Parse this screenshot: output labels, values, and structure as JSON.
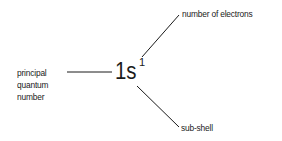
{
  "diagram": {
    "notation": {
      "main": "1s",
      "superscript": "1"
    },
    "labels": {
      "principal": [
        "principal",
        "quantum",
        "number"
      ],
      "electrons": "number of electrons",
      "subshell": "sub-shell"
    },
    "colors": {
      "text": "#1a1a1a",
      "line": "#1a1a1a",
      "background": "#ffffff"
    }
  }
}
